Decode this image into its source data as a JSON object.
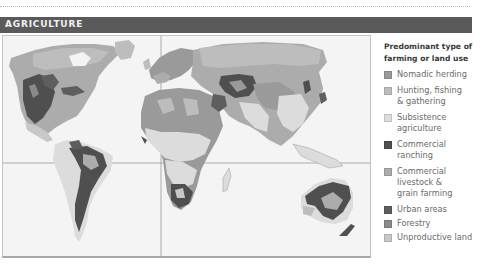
{
  "header": {
    "title": "AGRICULTURE"
  },
  "legend": {
    "title_line1": "Predominant type of",
    "title_line2": "farming or land use",
    "items": [
      {
        "label": "Nomadic herding",
        "color": "#9a9a9a"
      },
      {
        "label": "Hunting, fishing\n& gathering",
        "color": "#bdbdbd"
      },
      {
        "label": "Subsistence\nagriculture",
        "color": "#dcdcdc"
      },
      {
        "label": "Commercial\nranching",
        "color": "#4f4f4f"
      },
      {
        "label": "Commercial\nlivestock &\ngrain farming",
        "color": "#acacac"
      },
      {
        "label": "Urban areas",
        "color": "#5e5e5e"
      },
      {
        "label": "Forestry",
        "color": "#8a8a8a"
      },
      {
        "label": "Unproductive land",
        "color": "#c8c8c8"
      }
    ]
  },
  "map": {
    "ocean_color": "#f4f4f4",
    "gridline_color": "#9a9a9a",
    "equator_y": 127,
    "meridian_x": 158
  }
}
